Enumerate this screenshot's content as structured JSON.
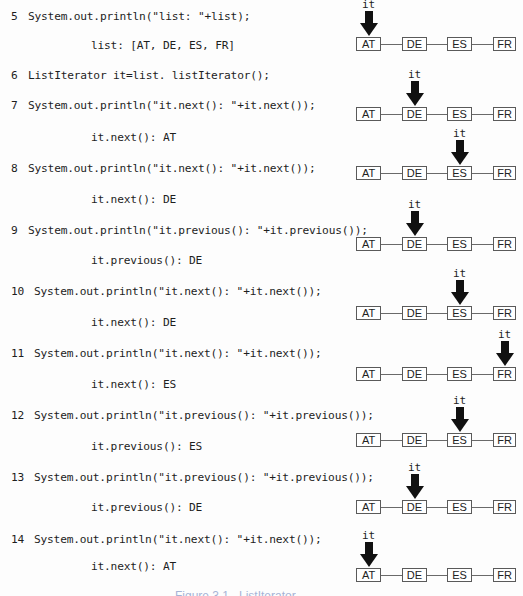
{
  "code": {
    "lines": [
      {
        "num": "5",
        "text": "System.out.println(\"list: \"+list);",
        "output": "list: [AT, DE, ES, FR]"
      },
      {
        "num": "6",
        "text": "ListIterator it=list. listIterator();",
        "output": ""
      },
      {
        "num": "7",
        "text": "System.out.println(\"it.next(): \"+it.next());",
        "output": "it.next(): AT"
      },
      {
        "num": "8",
        "text": "System.out.println(\"it.next(): \"+it.next());",
        "output": "it.next(): DE"
      },
      {
        "num": "9",
        "text": "System.out.println(\"it.previous(): \"+it.previous());",
        "output": "it.previous(): DE"
      },
      {
        "num": "10",
        "text": "System.out.println(\"it.next(): \"+it.next());",
        "output": "it.next(): DE"
      },
      {
        "num": "11",
        "text": "System.out.println(\"it.next(): \"+it.next());",
        "output": "it.next(): ES"
      },
      {
        "num": "12",
        "text": "System.out.println(\"it.previous(): \"+it.previous());",
        "output": "it.previous(): ES"
      },
      {
        "num": "13",
        "text": "System.out.println(\"it.previous(): \"+it.previous());",
        "output": "it.previous(): DE"
      },
      {
        "num": "14",
        "text": "System.out.println(\"it.next(): \"+it.next());",
        "output": "it.next(): AT"
      }
    ]
  },
  "diagram": {
    "nodes": [
      "AT",
      "DE",
      "ES",
      "FR"
    ],
    "pointer_label": "it",
    "states": [
      {
        "pointer_at": "AT"
      },
      {
        "pointer_at": "DE"
      },
      {
        "pointer_at": "ES"
      },
      {
        "pointer_at": "DE"
      },
      {
        "pointer_at": "ES"
      },
      {
        "pointer_at": "FR"
      },
      {
        "pointer_at": "ES"
      },
      {
        "pointer_at": "DE"
      },
      {
        "pointer_at": "AT"
      }
    ]
  },
  "caption": {
    "text": "Figure 3.1   ListIterator"
  }
}
